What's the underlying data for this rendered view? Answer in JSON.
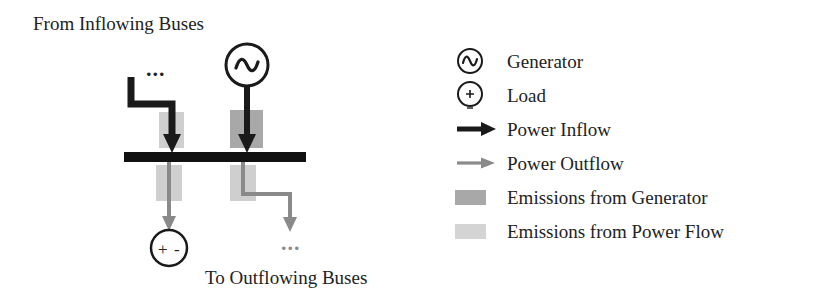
{
  "figure": {
    "title_top": "From Inflowing Buses",
    "title_bottom": "To Outflowing Buses",
    "ellipsis_inflow": "...",
    "ellipsis_outflow": "...",
    "generator_symbol": "sine-wave",
    "load_symbol_plus": "+",
    "load_symbol_minus": "-"
  },
  "legend": {
    "items": [
      {
        "label": "Generator",
        "icon": "generator-circle-icon"
      },
      {
        "label": "Load",
        "icon": "load-circle-icon"
      },
      {
        "label": "Power Inflow",
        "icon": "black-arrow-icon"
      },
      {
        "label": "Power Outflow",
        "icon": "gray-arrow-icon"
      },
      {
        "label": "Emissions from Generator",
        "icon": "dark-gray-swatch"
      },
      {
        "label": "Emissions from Power Flow",
        "icon": "light-gray-swatch"
      }
    ]
  },
  "colors": {
    "inflow": "#1a1a1a",
    "outflow": "#8a8a8a",
    "bus": "#111111",
    "emissions_generator": "#a8a8a8",
    "emissions_power_flow": "#cfcfcf",
    "text": "#222222",
    "background": "#ffffff"
  }
}
